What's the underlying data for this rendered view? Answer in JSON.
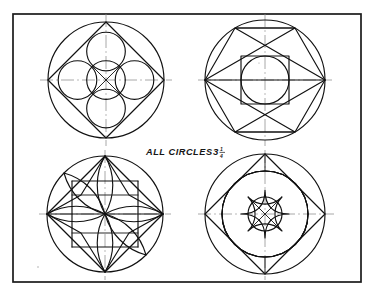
{
  "plate": {
    "title": "Geometric circle construction plate",
    "background_color": "#ffffff",
    "ink_color": "#111111",
    "axis_color": "#8b8b8b",
    "frame": {
      "name": "border-frame",
      "x": 13,
      "y": 14,
      "width": 348,
      "height": 268,
      "stroke_width": 1.7
    }
  },
  "annotation": {
    "name": "all-circles-note",
    "text": "ALL CIRCLES",
    "whole_number": "3",
    "fraction_numerator": "1",
    "fraction_denominator": "4",
    "full_text": "ALL CIRCLES 3 1/4",
    "x": 146,
    "y": 152
  },
  "figures": [
    {
      "id": "figure-top-left",
      "name": "rosette-four-circles-in-square",
      "position": "top-left",
      "center_x": 106,
      "center_y": 80,
      "radius": 58,
      "description": "Outer circle with inscribed diamond square, central circle and four tangent circles on the axes, plus diagonals",
      "elements": [
        "outer-circle",
        "inscribed-diamond-square",
        "center-circle",
        "north-circle",
        "east-circle",
        "south-circle",
        "west-circle",
        "diagonal-cross"
      ],
      "sub_circle_radius": 19.3,
      "sub_circle_offset": 38.6
    },
    {
      "id": "figure-top-right",
      "name": "hexagon-star-with-square-and-circle",
      "position": "top-right",
      "center_x": 265,
      "center_y": 80,
      "radius": 60,
      "description": "Outer circle with inscribed hexagon, crossing chords forming zigzag triangles, central square with inscribed circle",
      "elements": [
        "outer-circle",
        "inscribed-hexagon",
        "upper-chord-band",
        "lower-chord-band",
        "center-square",
        "center-inscribed-circle"
      ],
      "square_half": 24
    },
    {
      "id": "figure-bottom-left",
      "name": "five-point-pinwheel-star-rosette",
      "position": "bottom-left",
      "center_x": 105,
      "center_y": 214,
      "radius": 58,
      "description": "Outer circle containing a five-pointed pinwheel star overlaid with lens-shaped curved petals",
      "elements": [
        "outer-circle",
        "five-point-star",
        "curved-petal-north",
        "curved-petal-northeast",
        "curved-petal-southeast",
        "curved-petal-southwest",
        "curved-petal-west",
        "horizontal-axis"
      ],
      "star_points": 5
    },
    {
      "id": "figure-bottom-right",
      "name": "concentric-circles-with-curved-square-rosette",
      "position": "bottom-right",
      "center_x": 265,
      "center_y": 214,
      "radius": 60,
      "description": "Outer circle, inner circle, inscribed diamond, four large arcs forming petals, small central circle with curved square and diagonals",
      "elements": [
        "outer-circle",
        "inner-circle",
        "inscribed-diamond",
        "petal-arc-north",
        "petal-arc-east",
        "petal-arc-south",
        "petal-arc-west",
        "center-circle",
        "curved-square",
        "diagonal-cross"
      ],
      "inner_radius": 43,
      "center_circle_radius": 17
    }
  ]
}
